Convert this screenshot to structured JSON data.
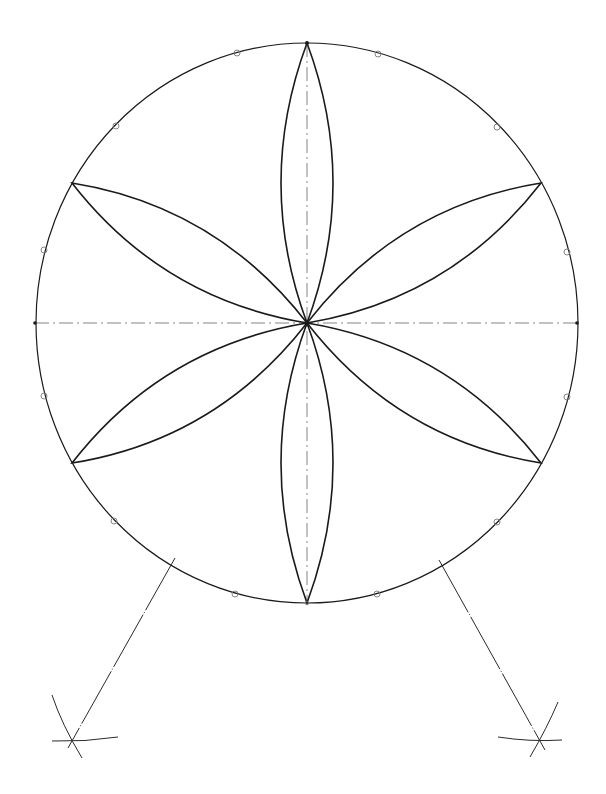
{
  "diagram": {
    "type": "geometric-construction",
    "colors": {
      "background": "#ffffff",
      "line": "#1a1a1a",
      "construction": "#555555",
      "marker": "#777777"
    },
    "circle": {
      "cx": 307,
      "cy": 323,
      "rx": 271,
      "ry": 280
    },
    "petal_tips": [
      {
        "x": 307,
        "y": 43
      },
      {
        "x": 541,
        "y": 183
      },
      {
        "x": 541,
        "y": 463
      },
      {
        "x": 307,
        "y": 603
      },
      {
        "x": 72,
        "y": 463
      },
      {
        "x": 72,
        "y": 183
      }
    ],
    "center_lines": {
      "horizontal": {
        "x1": 35,
        "y1": 323,
        "x2": 578,
        "y2": 323
      },
      "vertical": {
        "x1": 307,
        "y1": 43,
        "x2": 307,
        "y2": 603
      }
    },
    "division_markers": [
      {
        "x": 378,
        "y": 54
      },
      {
        "x": 497,
        "y": 127
      },
      {
        "x": 567,
        "y": 252
      },
      {
        "x": 567,
        "y": 397
      },
      {
        "x": 497,
        "y": 522
      },
      {
        "x": 377,
        "y": 594
      },
      {
        "x": 235,
        "y": 594
      },
      {
        "x": 114,
        "y": 521
      },
      {
        "x": 44,
        "y": 396
      },
      {
        "x": 44,
        "y": 250
      },
      {
        "x": 116,
        "y": 126
      },
      {
        "x": 237,
        "y": 53
      }
    ],
    "construction_lines": [
      {
        "x1": 172,
        "y1": 563,
        "x2": 72,
        "y2": 740
      },
      {
        "x1": 441,
        "y1": 564,
        "x2": 540,
        "y2": 741
      }
    ]
  }
}
